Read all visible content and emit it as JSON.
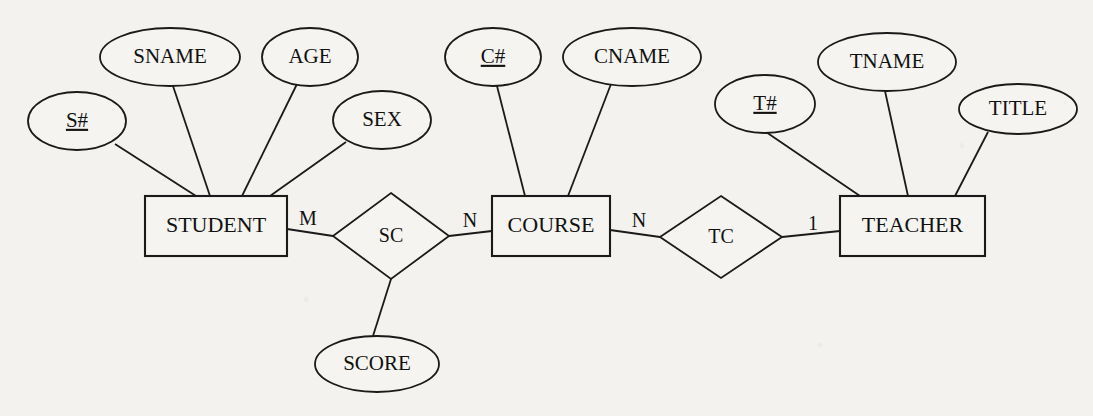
{
  "diagram": {
    "notation": "Chen",
    "colors": {
      "background": "#f3f2ee",
      "stroke": "#1a1a1a",
      "shape_fill": "#f5f4f0",
      "text": "#111111"
    },
    "entities": [
      {
        "id": "student",
        "label": "STUDENT",
        "shape": "rectangle",
        "x": 145,
        "y": 196,
        "w": 142,
        "h": 60
      },
      {
        "id": "course",
        "label": "COURSE",
        "shape": "rectangle",
        "x": 492,
        "y": 196,
        "w": 118,
        "h": 60
      },
      {
        "id": "teacher",
        "label": "TEACHER",
        "shape": "rectangle",
        "x": 840,
        "y": 196,
        "w": 145,
        "h": 60
      }
    ],
    "relationships": [
      {
        "id": "sc",
        "label": "SC",
        "shape": "diamond",
        "cx": 391,
        "cy": 236,
        "rx": 58,
        "ry": 43
      },
      {
        "id": "tc",
        "label": "TC",
        "shape": "diamond",
        "cx": 721,
        "cy": 237,
        "rx": 61,
        "ry": 41
      }
    ],
    "attributes": [
      {
        "id": "s_num",
        "label": "S#",
        "owner": "student",
        "key": true,
        "cx": 77,
        "cy": 121,
        "rx": 49,
        "ry": 29
      },
      {
        "id": "sname",
        "label": "SNAME",
        "owner": "student",
        "key": false,
        "cx": 170,
        "cy": 57,
        "rx": 70,
        "ry": 29
      },
      {
        "id": "age",
        "label": "AGE",
        "owner": "student",
        "key": false,
        "cx": 310,
        "cy": 57,
        "rx": 48,
        "ry": 29
      },
      {
        "id": "sex",
        "label": "SEX",
        "owner": "student",
        "key": false,
        "cx": 382,
        "cy": 120,
        "rx": 49,
        "ry": 29
      },
      {
        "id": "c_num",
        "label": "C#",
        "owner": "course",
        "key": true,
        "cx": 493,
        "cy": 57,
        "rx": 48,
        "ry": 29
      },
      {
        "id": "cname",
        "label": "CNAME",
        "owner": "course",
        "key": false,
        "cx": 632,
        "cy": 57,
        "rx": 69,
        "ry": 29
      },
      {
        "id": "t_num",
        "label": "T#",
        "owner": "teacher",
        "key": true,
        "cx": 765,
        "cy": 104,
        "rx": 50,
        "ry": 29
      },
      {
        "id": "tname",
        "label": "TNAME",
        "owner": "teacher",
        "key": false,
        "cx": 887,
        "cy": 62,
        "rx": 69,
        "ry": 29
      },
      {
        "id": "title",
        "label": "TITLE",
        "owner": "teacher",
        "key": false,
        "cx": 1018,
        "cy": 109,
        "rx": 59,
        "ry": 25
      },
      {
        "id": "score",
        "label": "SCORE",
        "owner": "sc",
        "key": false,
        "cx": 377,
        "cy": 364,
        "rx": 62,
        "ry": 28
      }
    ],
    "cardinalities": [
      {
        "id": "student-sc",
        "label": "M",
        "x": 308,
        "y": 220
      },
      {
        "id": "sc-course",
        "label": "N",
        "x": 470,
        "y": 222
      },
      {
        "id": "course-tc",
        "label": "N",
        "x": 639,
        "y": 222
      },
      {
        "id": "tc-teacher",
        "label": "1",
        "x": 813,
        "y": 225
      }
    ],
    "connectors": [
      {
        "id": "conn-snum-student",
        "x1": 115,
        "y1": 144,
        "x2": 196,
        "y2": 196
      },
      {
        "id": "conn-sname-student",
        "x1": 173,
        "y1": 86,
        "x2": 210,
        "y2": 196
      },
      {
        "id": "conn-age-student",
        "x1": 297,
        "y1": 84,
        "x2": 242,
        "y2": 196
      },
      {
        "id": "conn-sex-student",
        "x1": 346,
        "y1": 142,
        "x2": 270,
        "y2": 196
      },
      {
        "id": "conn-student-sc",
        "x1": 287,
        "y1": 229,
        "x2": 333,
        "y2": 236
      },
      {
        "id": "conn-sc-course",
        "x1": 449,
        "y1": 236,
        "x2": 492,
        "y2": 231
      },
      {
        "id": "conn-sc-score",
        "x1": 391,
        "y1": 279,
        "x2": 373,
        "y2": 336
      },
      {
        "id": "conn-cnum-course",
        "x1": 497,
        "y1": 86,
        "x2": 525,
        "y2": 196
      },
      {
        "id": "conn-cname-course",
        "x1": 611,
        "y1": 84,
        "x2": 568,
        "y2": 196
      },
      {
        "id": "conn-course-tc",
        "x1": 610,
        "y1": 230,
        "x2": 660,
        "y2": 237
      },
      {
        "id": "conn-tc-teacher",
        "x1": 782,
        "y1": 237,
        "x2": 840,
        "y2": 231
      },
      {
        "id": "conn-tnum-teacher",
        "x1": 766,
        "y1": 132,
        "x2": 860,
        "y2": 196
      },
      {
        "id": "conn-tname-teacher",
        "x1": 885,
        "y1": 91,
        "x2": 908,
        "y2": 196
      },
      {
        "id": "conn-title-teacher",
        "x1": 988,
        "y1": 132,
        "x2": 955,
        "y2": 196
      }
    ]
  }
}
